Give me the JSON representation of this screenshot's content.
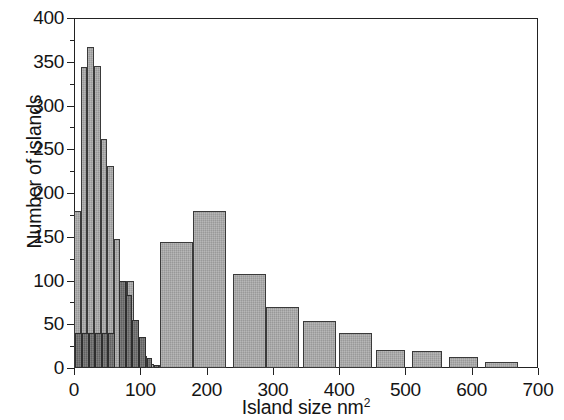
{
  "chart_data": {
    "type": "bar",
    "title": "",
    "xlabel": "Island size nm2",
    "xlabel_base": "Island size nm",
    "xlabel_exponent": "2",
    "ylabel": "Number of islands",
    "xlim": [
      0,
      700
    ],
    "ylim": [
      0,
      400
    ],
    "ytick_labels": [
      "0",
      "50",
      "100",
      "150",
      "200",
      "250",
      "300",
      "350",
      "400"
    ],
    "ytick_values": [
      0,
      50,
      100,
      150,
      200,
      250,
      300,
      350,
      400
    ],
    "yminor_values": [
      25,
      75,
      125,
      175,
      225,
      275,
      325,
      375
    ],
    "xtick_labels": [
      "0",
      "100",
      "200",
      "300",
      "400",
      "500",
      "600",
      "700"
    ],
    "xtick_values": [
      0,
      100,
      200,
      300,
      400,
      500,
      600,
      700
    ],
    "grid": false,
    "legend": "none",
    "colors": {
      "narrow_series": "#6e6e6e",
      "wide_series": "#a8a8a8",
      "axis": "#222222",
      "text": "#141414",
      "background": "#ffffff"
    },
    "series": [
      {
        "name": "wide-bin histogram",
        "style": "light-gray",
        "bin_width": 10,
        "bins": [
          {
            "x0": 0,
            "x1": 10,
            "value": 180
          },
          {
            "x0": 10,
            "x1": 20,
            "value": 344
          },
          {
            "x0": 20,
            "x1": 30,
            "value": 367
          },
          {
            "x0": 30,
            "x1": 40,
            "value": 345
          },
          {
            "x0": 40,
            "x1": 50,
            "value": 262
          },
          {
            "x0": 50,
            "x1": 60,
            "value": 231
          },
          {
            "x0": 60,
            "x1": 70,
            "value": 148
          },
          {
            "x0": 70,
            "x1": 80,
            "value": 100
          },
          {
            "x0": 80,
            "x1": 90,
            "value": 100
          },
          {
            "x0": 90,
            "x1": 100,
            "value": 35
          },
          {
            "x0": 100,
            "x1": 110,
            "value": 14
          },
          {
            "x0": 110,
            "x1": 120,
            "value": 5
          },
          {
            "x0": 120,
            "x1": 130,
            "value": 3
          }
        ]
      },
      {
        "name": "wide-bin histogram tail",
        "style": "light-gray",
        "bin_width": 50,
        "bins": [
          {
            "x0": 130,
            "x1": 180,
            "value": 144
          },
          {
            "x0": 180,
            "x1": 230,
            "value": 179
          },
          {
            "x0": 240,
            "x1": 290,
            "value": 107
          },
          {
            "x0": 290,
            "x1": 340,
            "value": 70
          },
          {
            "x0": 345,
            "x1": 395,
            "value": 54
          },
          {
            "x0": 400,
            "x1": 450,
            "value": 40
          },
          {
            "x0": 455,
            "x1": 500,
            "value": 21
          },
          {
            "x0": 510,
            "x1": 555,
            "value": 19
          },
          {
            "x0": 565,
            "x1": 610,
            "value": 13
          },
          {
            "x0": 620,
            "x1": 670,
            "value": 7
          }
        ]
      },
      {
        "name": "narrow-bin histogram",
        "style": "dark-gray",
        "bin_width": 10,
        "bins": [
          {
            "x0": 2,
            "x1": 12,
            "value": 40
          },
          {
            "x0": 12,
            "x1": 22,
            "value": 40
          },
          {
            "x0": 22,
            "x1": 32,
            "value": 40
          },
          {
            "x0": 32,
            "x1": 42,
            "value": 40
          },
          {
            "x0": 42,
            "x1": 52,
            "value": 40
          },
          {
            "x0": 52,
            "x1": 62,
            "value": 40
          },
          {
            "x0": 68,
            "x1": 78,
            "value": 100
          },
          {
            "x0": 78,
            "x1": 88,
            "value": 84
          },
          {
            "x0": 88,
            "x1": 98,
            "value": 55
          },
          {
            "x0": 98,
            "x1": 108,
            "value": 35
          },
          {
            "x0": 110,
            "x1": 118,
            "value": 12
          },
          {
            "x0": 120,
            "x1": 128,
            "value": 4
          }
        ]
      }
    ]
  }
}
